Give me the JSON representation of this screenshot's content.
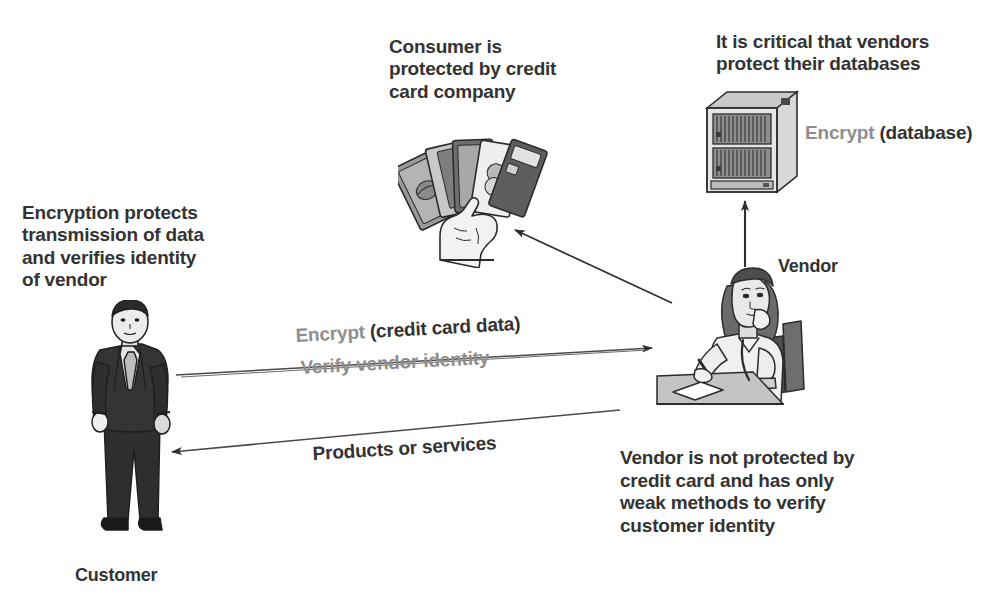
{
  "diagram": {
    "type": "flow-illustration",
    "colors": {
      "text_dark": "#333333",
      "text_gray": "#8e8e8e",
      "line": "#3d3d3d",
      "background": "#ffffff"
    }
  },
  "annotations": {
    "consumer_protection": "Consumer is\nprotected by credit\ncard company",
    "vendor_databases": "It is critical that vendors\nprotect their databases",
    "encryption_protects": "Encryption protects\ntransmission of data\nand verifies identity\nof vendor",
    "vendor_not_protected_pre": "Vendor is ",
    "vendor_not_protected_emphasis": "not",
    "vendor_not_protected_post": " protected by\ncredit card and has only\nweak methods to verify\ncustomer identity"
  },
  "labels": {
    "vendor": "Vendor",
    "customer": "Customer"
  },
  "flows": [
    {
      "id": "encrypt-database",
      "label_gray": "Encrypt",
      "label_dark": " (database)",
      "from": "vendor",
      "to": "database-server",
      "direction": "up"
    },
    {
      "id": "encrypt-credit-card-data",
      "label_gray": "Encrypt",
      "label_dark": " (credit card data)",
      "from": "customer",
      "to": "vendor",
      "direction": "right"
    },
    {
      "id": "verify-vendor-identity",
      "label_gray": "Verify vendor identity",
      "label_dark": "",
      "from": "customer",
      "to": "vendor",
      "direction": "right"
    },
    {
      "id": "products-or-services",
      "label_gray": "",
      "label_dark": "Products or services",
      "from": "vendor",
      "to": "customer",
      "direction": "left"
    },
    {
      "id": "vendor-to-consumer-cards",
      "label_gray": "",
      "label_dark": "",
      "from": "vendor",
      "to": "credit-cards",
      "direction": "up-left"
    }
  ],
  "illustrations": {
    "server": "database-server-cabinet",
    "cards": "hand-holding-credit-cards",
    "vendor": "woman-at-desk-writing",
    "customer": "man-in-suit-standing"
  }
}
